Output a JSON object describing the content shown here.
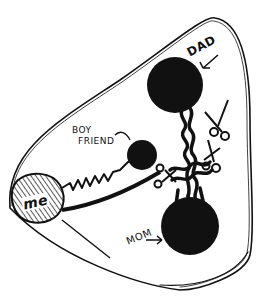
{
  "diagram": {
    "style": "hand-drawn ink sketch, black on white",
    "header_text": "",
    "colors": {
      "ink": "#111111",
      "background": "#ffffff"
    },
    "nodes": [
      {
        "id": "dad",
        "label": "DAD",
        "shape": "filled-circle"
      },
      {
        "id": "boyfriend",
        "label": "BOY FRIEND",
        "label_lines": [
          "BOY",
          "FRIEND"
        ],
        "shape": "filled-circle-small"
      },
      {
        "id": "me",
        "label": "me",
        "shape": "hatched-circle"
      },
      {
        "id": "mom",
        "label": "MOM",
        "shape": "filled-circle"
      }
    ],
    "connections": [
      {
        "from": "me",
        "to": "boyfriend",
        "style": "zigzag"
      },
      {
        "from": "me",
        "to": "mom",
        "style": "thick-line"
      },
      {
        "from": "dad",
        "to": "mom",
        "style": "tangled-knotted-cord"
      }
    ],
    "decorations": [
      {
        "type": "scissors-icon",
        "count": 2,
        "position": "cutting cord between dad and mom"
      },
      {
        "type": "enclosing-outline",
        "shape": "kidney/bean loop"
      }
    ]
  }
}
